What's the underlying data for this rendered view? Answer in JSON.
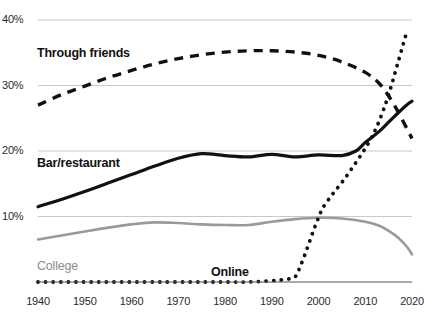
{
  "chart_data": {
    "type": "line",
    "title": "",
    "subtitle": "",
    "xlabel": "",
    "ylabel": "",
    "grid": true,
    "legend_position": "inline-labels",
    "xlim": [
      1940,
      2020
    ],
    "ylim": [
      0,
      40
    ],
    "x_ticks": [
      "1940",
      "1950",
      "1960",
      "1970",
      "1980",
      "1990",
      "2000",
      "2010",
      "2020"
    ],
    "y_ticks": [
      "10%",
      "20%",
      "30%",
      "40%"
    ],
    "y_tick_values": [
      10,
      20,
      30,
      40
    ],
    "series": [
      {
        "name": "Through friends",
        "style": "dashed",
        "color": "#111111",
        "label": "Through friends",
        "x": [
          1940,
          1945,
          1950,
          1955,
          1960,
          1965,
          1970,
          1975,
          1980,
          1985,
          1990,
          1995,
          2000,
          2005,
          2010,
          2013,
          2015,
          2017,
          2019,
          2020
        ],
        "values": [
          27.0,
          28.6,
          29.9,
          31.2,
          32.3,
          33.3,
          34.1,
          34.7,
          35.1,
          35.3,
          35.3,
          35.1,
          34.6,
          33.6,
          32.0,
          30.3,
          28.4,
          26.0,
          23.3,
          21.9
        ]
      },
      {
        "name": "Bar/restaurant",
        "style": "solid",
        "color": "#111111",
        "label": "Bar/restaurant",
        "x": [
          1940,
          1945,
          1950,
          1955,
          1960,
          1965,
          1970,
          1975,
          1980,
          1985,
          1990,
          1995,
          2000,
          2005,
          2008,
          2010,
          2013,
          2015,
          2017,
          2019,
          2020
        ],
        "values": [
          11.5,
          12.6,
          13.8,
          15.1,
          16.4,
          17.7,
          18.9,
          19.6,
          19.3,
          19.1,
          19.5,
          19.1,
          19.4,
          19.3,
          20.0,
          21.3,
          23.0,
          24.4,
          25.8,
          27.1,
          27.6
        ]
      },
      {
        "name": "College",
        "style": "solid",
        "color": "#9a9a9a",
        "label": "College",
        "x": [
          1940,
          1945,
          1950,
          1955,
          1960,
          1965,
          1970,
          1975,
          1980,
          1985,
          1990,
          1995,
          2000,
          2005,
          2010,
          2013,
          2015,
          2017,
          2019,
          2020
        ],
        "values": [
          6.5,
          7.1,
          7.7,
          8.3,
          8.8,
          9.1,
          9.0,
          8.8,
          8.7,
          8.7,
          9.2,
          9.6,
          9.8,
          9.7,
          9.2,
          8.6,
          7.8,
          6.8,
          5.3,
          4.2
        ]
      },
      {
        "name": "Online",
        "style": "dotted",
        "color": "#111111",
        "label": "Online",
        "x": [
          1940,
          1975,
          1980,
          1985,
          1990,
          1993,
          1995,
          1996,
          1997,
          1998,
          1999,
          2000,
          2001,
          2003,
          2005,
          2007,
          2009,
          2011,
          2013,
          2015,
          2017,
          2019
        ],
        "values": [
          0.0,
          0.0,
          0.0,
          0.0,
          0.2,
          0.4,
          0.8,
          2.2,
          4.0,
          6.0,
          8.0,
          9.8,
          11.4,
          13.4,
          15.2,
          17.2,
          19.3,
          21.6,
          24.6,
          28.6,
          33.5,
          38.5
        ]
      }
    ],
    "annotations": [
      {
        "text": "Through friends",
        "series": "Through friends",
        "x_px": 37,
        "y_px": 46
      },
      {
        "text": "Bar/restaurant",
        "series": "Bar/restaurant",
        "x_px": 37,
        "y_px": 156
      },
      {
        "text": "College",
        "series": "College",
        "x_px": 37,
        "y_px": 259
      },
      {
        "text": "Online",
        "series": "Online",
        "x_px": 211,
        "y_px": 265
      }
    ]
  }
}
